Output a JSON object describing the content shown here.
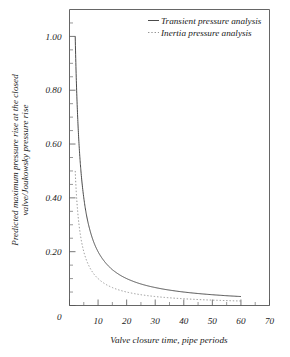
{
  "chart_data": {
    "type": "line",
    "title": "",
    "xlabel": "Valve closure time, pipe periods",
    "ylabel": "Predicted maximum pressure rise at the closed valve/Joukowsky pressure rise",
    "ylabel_line1": "Predicted maximum pressure rise at the closed",
    "ylabel_line2": "valve/Joukowsky pressure rise",
    "xlim": [
      0,
      70
    ],
    "ylim": [
      0,
      1.1
    ],
    "grid": false,
    "legend_position": "top-right",
    "xticks": [
      0,
      10,
      20,
      30,
      40,
      50,
      60,
      70
    ],
    "xticklabels": [
      "",
      "10",
      "20",
      "30",
      "40",
      "50",
      "60",
      "70"
    ],
    "xticks_minor": [
      5,
      15,
      25,
      35,
      45,
      55,
      65
    ],
    "yticks": [
      0.0,
      0.2,
      0.4,
      0.6,
      0.8,
      1.0
    ],
    "yticklabels": [
      "0",
      "0.20",
      "0.40",
      "0.60",
      "0.80",
      "1.00"
    ],
    "yticks_minor": [
      0.05,
      0.1,
      0.15,
      0.25,
      0.3,
      0.35,
      0.45,
      0.5,
      0.55,
      0.65,
      0.7,
      0.75,
      0.85,
      0.9,
      0.95,
      1.05
    ],
    "series": [
      {
        "name": "Transient pressure analysis",
        "style": "solid",
        "color": "#4a4a4a",
        "x": [
          2,
          2.5,
          3,
          3.5,
          4,
          5,
          6,
          7,
          8,
          9,
          10,
          11,
          12,
          13,
          14,
          15,
          16,
          18,
          20,
          22,
          24,
          26,
          28,
          30,
          33,
          36,
          40,
          44,
          48,
          52,
          56,
          60
        ],
        "y": [
          1.0,
          0.8,
          0.667,
          0.571,
          0.5,
          0.4,
          0.333,
          0.286,
          0.25,
          0.222,
          0.2,
          0.182,
          0.167,
          0.154,
          0.143,
          0.133,
          0.125,
          0.111,
          0.1,
          0.091,
          0.0833,
          0.0769,
          0.0714,
          0.0667,
          0.0606,
          0.0556,
          0.05,
          0.0455,
          0.0417,
          0.0385,
          0.0357,
          0.0333
        ]
      },
      {
        "name": "Inertia pressure analysis",
        "style": "dotted",
        "color": "#8a8a8a",
        "x": [
          2,
          2.5,
          3,
          3.5,
          4,
          5,
          6,
          7,
          8,
          9,
          10,
          11,
          12,
          13,
          14,
          15,
          16,
          18,
          20,
          22,
          24,
          26,
          28,
          30,
          33,
          36,
          40,
          44,
          48,
          52,
          56,
          60
        ],
        "y": [
          0.5,
          0.4,
          0.333,
          0.286,
          0.25,
          0.2,
          0.167,
          0.143,
          0.125,
          0.111,
          0.1,
          0.0909,
          0.0833,
          0.0769,
          0.0714,
          0.0667,
          0.0625,
          0.0556,
          0.05,
          0.0455,
          0.0417,
          0.0385,
          0.0357,
          0.0333,
          0.0303,
          0.0278,
          0.025,
          0.0227,
          0.0208,
          0.0192,
          0.0179,
          0.0167
        ]
      }
    ],
    "legend": [
      {
        "label": "Transient pressure analysis",
        "style": "solid"
      },
      {
        "label": "Inertia pressure analysis",
        "style": "dotted"
      }
    ]
  }
}
